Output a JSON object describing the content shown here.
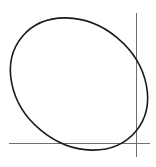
{
  "diagram": {
    "type": "ellipse-with-axes",
    "colors": {
      "background": "#ffffff",
      "ellipse_stroke": "#1a1a1a",
      "axis_stroke": "#707070"
    },
    "elements": [
      {
        "name": "ellipse",
        "kind": "curve"
      },
      {
        "name": "x-axis",
        "kind": "line",
        "orientation": "horizontal"
      },
      {
        "name": "y-axis",
        "kind": "line",
        "orientation": "vertical"
      }
    ],
    "labels": []
  }
}
